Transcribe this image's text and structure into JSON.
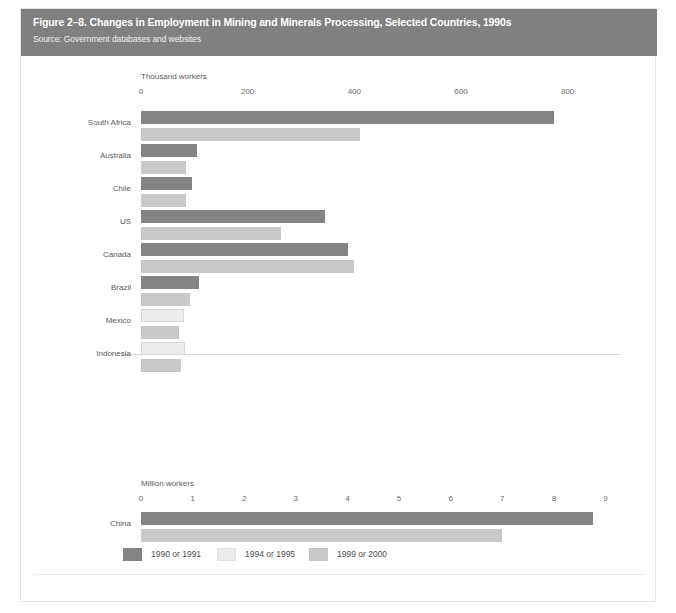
{
  "header": {
    "title": "Figure 2–8. Changes in Employment in Mining and Minerals Processing, Selected Countries, 1990s",
    "source": "Source: Government databases and websites",
    "band_color": "#808080"
  },
  "legend": {
    "items": [
      {
        "label": "1990 or 1991",
        "color": "#848484",
        "series_key": "s1"
      },
      {
        "label": "1994 or 1995",
        "color": "#ececec",
        "series_key": "s2"
      },
      {
        "label": "1999 or 2000",
        "color": "#c9c9c9",
        "series_key": "s3"
      }
    ]
  },
  "chart_data": {
    "type": "bar",
    "orientation": "horizontal",
    "title": "Figure 2–8. Changes in Employment in Mining and Minerals Processing, Selected Countries, 1990s",
    "subtitle": "Source: Government databases and websites",
    "grid": false,
    "legend_position": "bottom",
    "panels": [
      {
        "name": "thousand-workers-panel",
        "xlabel": "Thousand workers",
        "ylabel": "",
        "xlim": [
          0,
          900
        ],
        "xticks": [
          0,
          200,
          400,
          600,
          800
        ],
        "xtick_labels": [
          "0",
          "200",
          "400",
          "600",
          "800"
        ],
        "categories": [
          "South Africa",
          "Australia",
          "Chile",
          "US",
          "Canada",
          "Brazil",
          "Mexico",
          "Indonesia"
        ],
        "bars": [
          {
            "category": "South Africa",
            "series": "1990 or 1991",
            "value": 775
          },
          {
            "category": "South Africa",
            "series": "1999 or 2000",
            "value": 410
          },
          {
            "category": "Australia",
            "series": "1990 or 1991",
            "value": 105
          },
          {
            "category": "Australia",
            "series": "1999 or 2000",
            "value": 85
          },
          {
            "category": "Chile",
            "series": "1990 or 1991",
            "value": 95
          },
          {
            "category": "Chile",
            "series": "1999 or 2000",
            "value": 85
          },
          {
            "category": "US",
            "series": "1990 or 1991",
            "value": 345
          },
          {
            "category": "US",
            "series": "1999 or 2000",
            "value": 262
          },
          {
            "category": "Canada",
            "series": "1990 or 1991",
            "value": 388
          },
          {
            "category": "Canada",
            "series": "1999 or 2000",
            "value": 400
          },
          {
            "category": "Brazil",
            "series": "1990 or 1991",
            "value": 108
          },
          {
            "category": "Brazil",
            "series": "1999 or 2000",
            "value": 92
          },
          {
            "category": "Mexico",
            "series": "1994 or 1995",
            "value": 80
          },
          {
            "category": "Mexico",
            "series": "1999 or 2000",
            "value": 72
          },
          {
            "category": "Indonesia",
            "series": "1994 or 1995",
            "value": 82
          },
          {
            "category": "Indonesia",
            "series": "1999 or 2000",
            "value": 75
          }
        ]
      },
      {
        "name": "million-workers-panel",
        "xlabel": "Million workers",
        "ylabel": "",
        "xlim": [
          0,
          9.3
        ],
        "xticks": [
          0,
          1,
          2,
          3,
          4,
          5,
          6,
          7,
          8,
          9
        ],
        "xtick_labels": [
          "0",
          "1",
          "2",
          "3",
          "4",
          "5",
          "6",
          "7",
          "8",
          "9"
        ],
        "categories": [
          "China"
        ],
        "bars": [
          {
            "category": "China",
            "series": "1990 or 1991",
            "value": 8.75
          },
          {
            "category": "China",
            "series": "1999 or 2000",
            "value": 7.0
          }
        ]
      }
    ]
  },
  "axes": {
    "top": {
      "unit_label": "Thousand workers",
      "tick_labels": [
        "0",
        "200",
        "400",
        "600",
        "800"
      ]
    },
    "bottom": {
      "unit_label": "Million workers",
      "tick_labels": [
        "0",
        "1",
        "2",
        "3",
        "4",
        "5",
        "6",
        "7",
        "8",
        "9"
      ]
    }
  },
  "categories": {
    "top_panel": [
      "South Africa",
      "Australia",
      "Chile",
      "US",
      "Canada",
      "Brazil",
      "Mexico",
      "Indonesia"
    ],
    "bottom_panel": [
      "China"
    ]
  }
}
